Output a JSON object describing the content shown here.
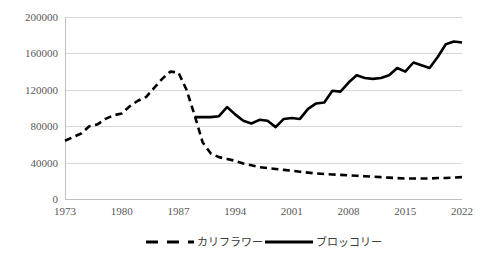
{
  "chart_data": {
    "type": "line",
    "title": "",
    "subtitle": "",
    "xlabel": "",
    "ylabel": "",
    "xlim": [
      1973,
      2022
    ],
    "ylim": [
      0,
      200000
    ],
    "grid": true,
    "legend_position": "bottom",
    "y_ticks": [
      "0",
      "40000",
      "80000",
      "120000",
      "160000",
      "200000"
    ],
    "y_tick_values": [
      0,
      40000,
      80000,
      120000,
      160000,
      200000
    ],
    "x_ticks": [
      "1973",
      "1980",
      "1987",
      "1994",
      "2001",
      "2008",
      "2015",
      "2022"
    ],
    "x_tick_values": [
      1973,
      1980,
      1987,
      1994,
      2001,
      2008,
      2015,
      2022
    ],
    "x": [
      1973,
      1974,
      1975,
      1976,
      1977,
      1978,
      1979,
      1980,
      1981,
      1982,
      1983,
      1984,
      1985,
      1986,
      1987,
      1988,
      1989,
      1990,
      1991,
      1992,
      1993,
      1994,
      1995,
      1996,
      1997,
      1998,
      1999,
      2000,
      2001,
      2002,
      2003,
      2004,
      2005,
      2006,
      2007,
      2008,
      2009,
      2010,
      2011,
      2012,
      2013,
      2014,
      2015,
      2016,
      2017,
      2018,
      2019,
      2020,
      2021,
      2022
    ],
    "series": [
      {
        "name": "カリフラワー",
        "style": "dashed",
        "color": "#000000",
        "values": [
          64000,
          68000,
          72000,
          80000,
          82000,
          88000,
          92000,
          94000,
          102000,
          108000,
          112000,
          122000,
          132000,
          140000,
          139000,
          120000,
          92000,
          62000,
          50000,
          46000,
          44000,
          42000,
          39000,
          37000,
          35000,
          34000,
          33000,
          32000,
          31000,
          30000,
          29000,
          28000,
          27500,
          27000,
          26500,
          26000,
          25500,
          25000,
          24500,
          24000,
          23500,
          23000,
          22500,
          22500,
          22500,
          22500,
          23000,
          23000,
          23500,
          24000
        ]
      },
      {
        "name": "ブロッコリー",
        "style": "solid",
        "color": "#000000",
        "values": [
          null,
          null,
          null,
          null,
          null,
          null,
          null,
          null,
          null,
          null,
          null,
          null,
          null,
          null,
          null,
          null,
          90000,
          90000,
          90000,
          91000,
          101000,
          93000,
          86000,
          83000,
          87000,
          86000,
          79000,
          88000,
          89000,
          88000,
          99000,
          105000,
          106000,
          119000,
          118000,
          128000,
          136000,
          133000,
          132000,
          133000,
          136000,
          144000,
          140000,
          150000,
          147000,
          144000,
          156000,
          170000,
          173000,
          172000
        ]
      }
    ],
    "legend": [
      {
        "label": "カリフラワー",
        "style": "dashed"
      },
      {
        "label": "ブロッコリー",
        "style": "solid"
      }
    ]
  }
}
